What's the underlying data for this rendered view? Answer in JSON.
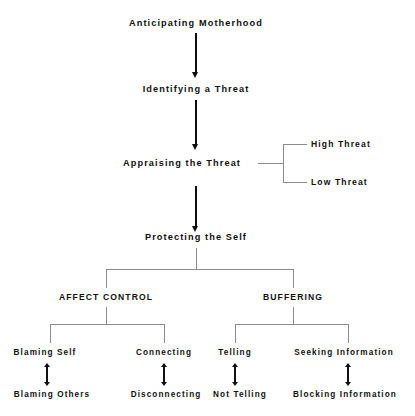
{
  "diagram": {
    "title": "Anticipating Motherhood",
    "nodes": {
      "anticipating_motherhood": "Anticipating Motherhood",
      "identifying_threat": "Identifying a Threat",
      "appraising_threat": "Appraising the Threat",
      "high_threat": "High Threat",
      "low_threat": "Low Threat",
      "protecting_self": "Protecting the Self",
      "affect_control": "AFFECT CONTROL",
      "buffering": "BUFFERING",
      "blaming_self": "Blaming Self",
      "blaming_others": "Blaming Others",
      "connecting": "Connecting",
      "disconnecting": "Disconnecting",
      "telling": "Telling",
      "not_telling": "Not Telling",
      "seeking_information": "Seeking Information",
      "blocking_information": "Blocking Information"
    },
    "colors": {
      "text": "#111111",
      "arrow": "#0d0d0d",
      "connector": "#8c8c8c",
      "background": "#ffffff"
    }
  }
}
